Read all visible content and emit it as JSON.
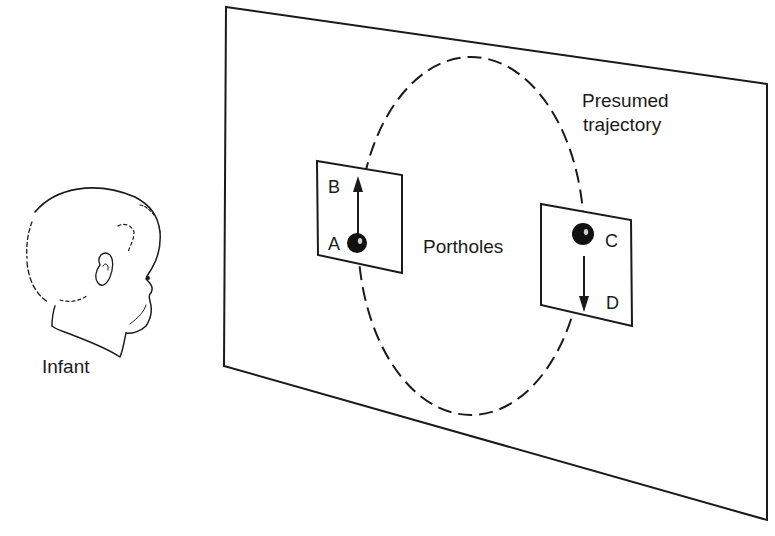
{
  "figure": {
    "infant": {
      "label": "Infant"
    },
    "screen": {
      "trajectory_label_line1": "Presumed",
      "trajectory_label_line2": "trajectory",
      "portholes_label": "Portholes"
    },
    "left_porthole": {
      "top_label": "B",
      "bottom_label": "A",
      "motion_direction": "up"
    },
    "right_porthole": {
      "top_label": "C",
      "bottom_label": "D",
      "motion_direction": "down"
    },
    "colors": {
      "ink": "#1a1a1a",
      "background": "#ffffff"
    }
  }
}
